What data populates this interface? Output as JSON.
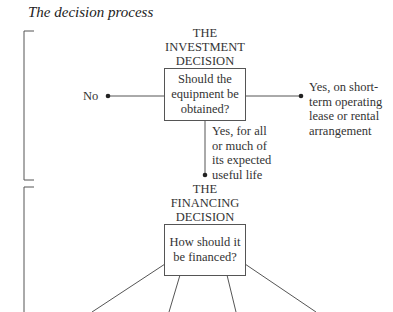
{
  "title": "The decision process",
  "investment": {
    "header_line1": "THE",
    "header_line2": "INVESTMENT",
    "header_line3": "DECISION",
    "question_line1": "Should the",
    "question_line2": "equipment be",
    "question_line3": "obtained?",
    "no_label": "No",
    "yes_short_line1": "Yes, on short-",
    "yes_short_line2": "term operating",
    "yes_short_line3": "lease or rental",
    "yes_short_line4": "arrangement",
    "yes_long_line1": "Yes, for all",
    "yes_long_line2": "or much of",
    "yes_long_line3": "its expected",
    "yes_long_line4": "useful life"
  },
  "financing": {
    "header_line1": "THE",
    "header_line2": "FINANCING",
    "header_line3": "DECISION",
    "question_line1": "How should it",
    "question_line2": "be financed?"
  },
  "colors": {
    "line": "#555555",
    "text": "#333333",
    "background": "#ffffff"
  }
}
